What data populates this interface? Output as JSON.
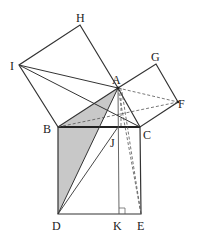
{
  "diagram": {
    "points": {
      "A": {
        "x": 118,
        "y": 88,
        "lx": 112,
        "ly": 84
      },
      "B": {
        "x": 58,
        "y": 127,
        "lx": 43,
        "ly": 132
      },
      "C": {
        "x": 140,
        "y": 127,
        "lx": 144,
        "ly": 139
      },
      "D": {
        "x": 58,
        "y": 214,
        "lx": 52,
        "ly": 230
      },
      "E": {
        "x": 141,
        "y": 214,
        "lx": 137,
        "ly": 230
      },
      "F": {
        "x": 178,
        "y": 102,
        "lx": 178,
        "ly": 107
      },
      "G": {
        "x": 156,
        "y": 64,
        "lx": 152,
        "ly": 60
      },
      "H": {
        "x": 80,
        "y": 25,
        "lx": 76,
        "ly": 22
      },
      "I": {
        "x": 19,
        "y": 65,
        "lx": 9,
        "ly": 70
      },
      "J": {
        "x": 118,
        "y": 127,
        "lx": 109,
        "ly": 146
      },
      "K": {
        "x": 119,
        "y": 214,
        "lx": 113,
        "ly": 230
      }
    },
    "labels": [
      "A",
      "B",
      "C",
      "D",
      "E",
      "F",
      "G",
      "H",
      "I",
      "J",
      "K"
    ],
    "shaded_region": "triangle B-D-(A side) and quadrilateral ABD",
    "colors": {
      "line": "#333333",
      "shade": "#c8c8c8",
      "dash": "#555555"
    }
  }
}
